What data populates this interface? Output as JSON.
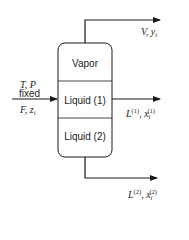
{
  "diagram": {
    "type": "three-phase flash vessel",
    "colors": {
      "line": "#1a1a1a",
      "background": "#ffffff"
    },
    "vessel": {
      "zones": [
        {
          "label": "Vapor"
        },
        {
          "label": "Liquid (1)"
        },
        {
          "label": "Liquid (2)"
        }
      ]
    },
    "feed": {
      "conditions_line1": "T, P",
      "conditions_line2": "fixed",
      "stream_var": "F",
      "stream_comp": "z",
      "stream_comp_sub": "i"
    },
    "outlets": {
      "vapor": {
        "flow": "V",
        "comp": "y",
        "comp_sub": "i"
      },
      "liquid1": {
        "flow": "L",
        "flow_sup": "(1)",
        "comp": "x",
        "comp_sub": "i",
        "comp_sup": "(1)"
      },
      "liquid2": {
        "flow": "L",
        "flow_sup": "(2)",
        "comp": "x",
        "comp_sub": "i",
        "comp_sup": "(2)"
      }
    }
  }
}
